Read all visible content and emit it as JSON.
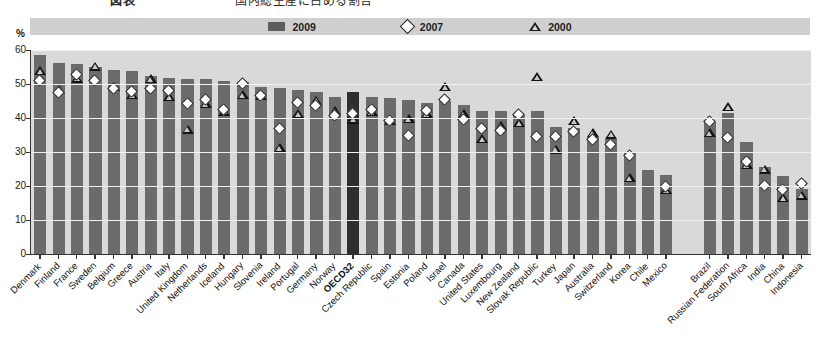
{
  "header": {
    "remnant_left": "図表",
    "remnant_right": "国内総生産に占める割合"
  },
  "axis_unit": "%",
  "legend": [
    {
      "label": "2009",
      "marker": "filled-square",
      "color": "#5d5d5d"
    },
    {
      "label": "2007",
      "marker": "open-diamond",
      "color": "#ffffff"
    },
    {
      "label": "2000",
      "marker": "open-triangle",
      "color": "#1a1a1a"
    }
  ],
  "colors": {
    "bar": "#6b6b6b",
    "bar_highlight": "#2e2e2e",
    "plot_background": "#d9d9d9",
    "legend_band": "#cfcfcf",
    "gridline": "#f2f2f2",
    "axis": "#333333"
  },
  "chart_data": {
    "type": "bar",
    "title": "",
    "subtitle": "",
    "xlabel": "",
    "ylabel": "%",
    "ylim": [
      0,
      60
    ],
    "yticks": [
      0,
      10,
      20,
      30,
      40,
      50,
      60
    ],
    "grid": true,
    "legend_position": "top-center",
    "gap_after_category": "Mexico",
    "highlight_category": "OECD32",
    "categories": [
      "Denmark",
      "Finland",
      "France",
      "Sweden",
      "Belgium",
      "Greece",
      "Austria",
      "Italy",
      "United Kingdom",
      "Netherlands",
      "Iceland",
      "Hungary",
      "Slovenia",
      "Ireland",
      "Portugal",
      "Germany",
      "Norway",
      "OECD32",
      "Czech Republic",
      "Spain",
      "Estonia",
      "Poland",
      "Israel",
      "Canada",
      "United States",
      "Luxembourg",
      "New Zealand",
      "Slovak Republic",
      "Turkey",
      "Japan",
      "Australia",
      "Switzerland",
      "Korea",
      "Chile",
      "Mexico",
      "Brazil",
      "Russian Federation",
      "South Africa",
      "India",
      "China",
      "Indonesia"
    ],
    "series": [
      {
        "name": "2009",
        "marker": "bar",
        "values": [
          58.4,
          56.3,
          56.0,
          54.9,
          54.0,
          53.8,
          52.3,
          51.9,
          51.6,
          51.4,
          51.0,
          50.5,
          49.0,
          48.9,
          48.2,
          47.6,
          46.3,
          47.7,
          46.1,
          45.8,
          45.2,
          44.5,
          45.0,
          43.8,
          42.2,
          42.2,
          41.1,
          42.0,
          37.5,
          37.0,
          34.3,
          33.7,
          30.0,
          24.7,
          23.2,
          38.8,
          41.4,
          33.0,
          25.7,
          23.0,
          19.2
        ]
      },
      {
        "name": "2007",
        "marker": "open-diamond",
        "values": [
          50.8,
          47.4,
          52.6,
          51.0,
          48.4,
          47.6,
          48.5,
          47.9,
          44.0,
          45.3,
          42.3,
          49.9,
          46.4,
          36.7,
          44.4,
          43.5,
          40.6,
          41.3,
          42.5,
          39.2,
          34.8,
          42.2,
          45.3,
          39.3,
          36.8,
          36.2,
          41.0,
          34.4,
          34.3,
          35.9,
          33.5,
          32.0,
          28.7,
          null,
          19.6,
          38.8,
          34.2,
          27.2,
          20.0,
          18.7,
          20.5
        ]
      },
      {
        "name": "2000",
        "marker": "open-triangle",
        "values": [
          53.7,
          48.3,
          51.6,
          55.1,
          49.1,
          46.7,
          51.5,
          46.2,
          36.6,
          44.2,
          41.9,
          46.8,
          46.5,
          31.2,
          41.1,
          45.1,
          42.0,
          39.5,
          41.8,
          39.1,
          39.6,
          41.1,
          49.0,
          41.1,
          33.9,
          37.6,
          38.4,
          52.1,
          30.7,
          39.0,
          35.5,
          35.1,
          22.4,
          null,
          18.9,
          35.5,
          43.2,
          26.1,
          24.8,
          16.5,
          17.2
        ]
      }
    ]
  }
}
